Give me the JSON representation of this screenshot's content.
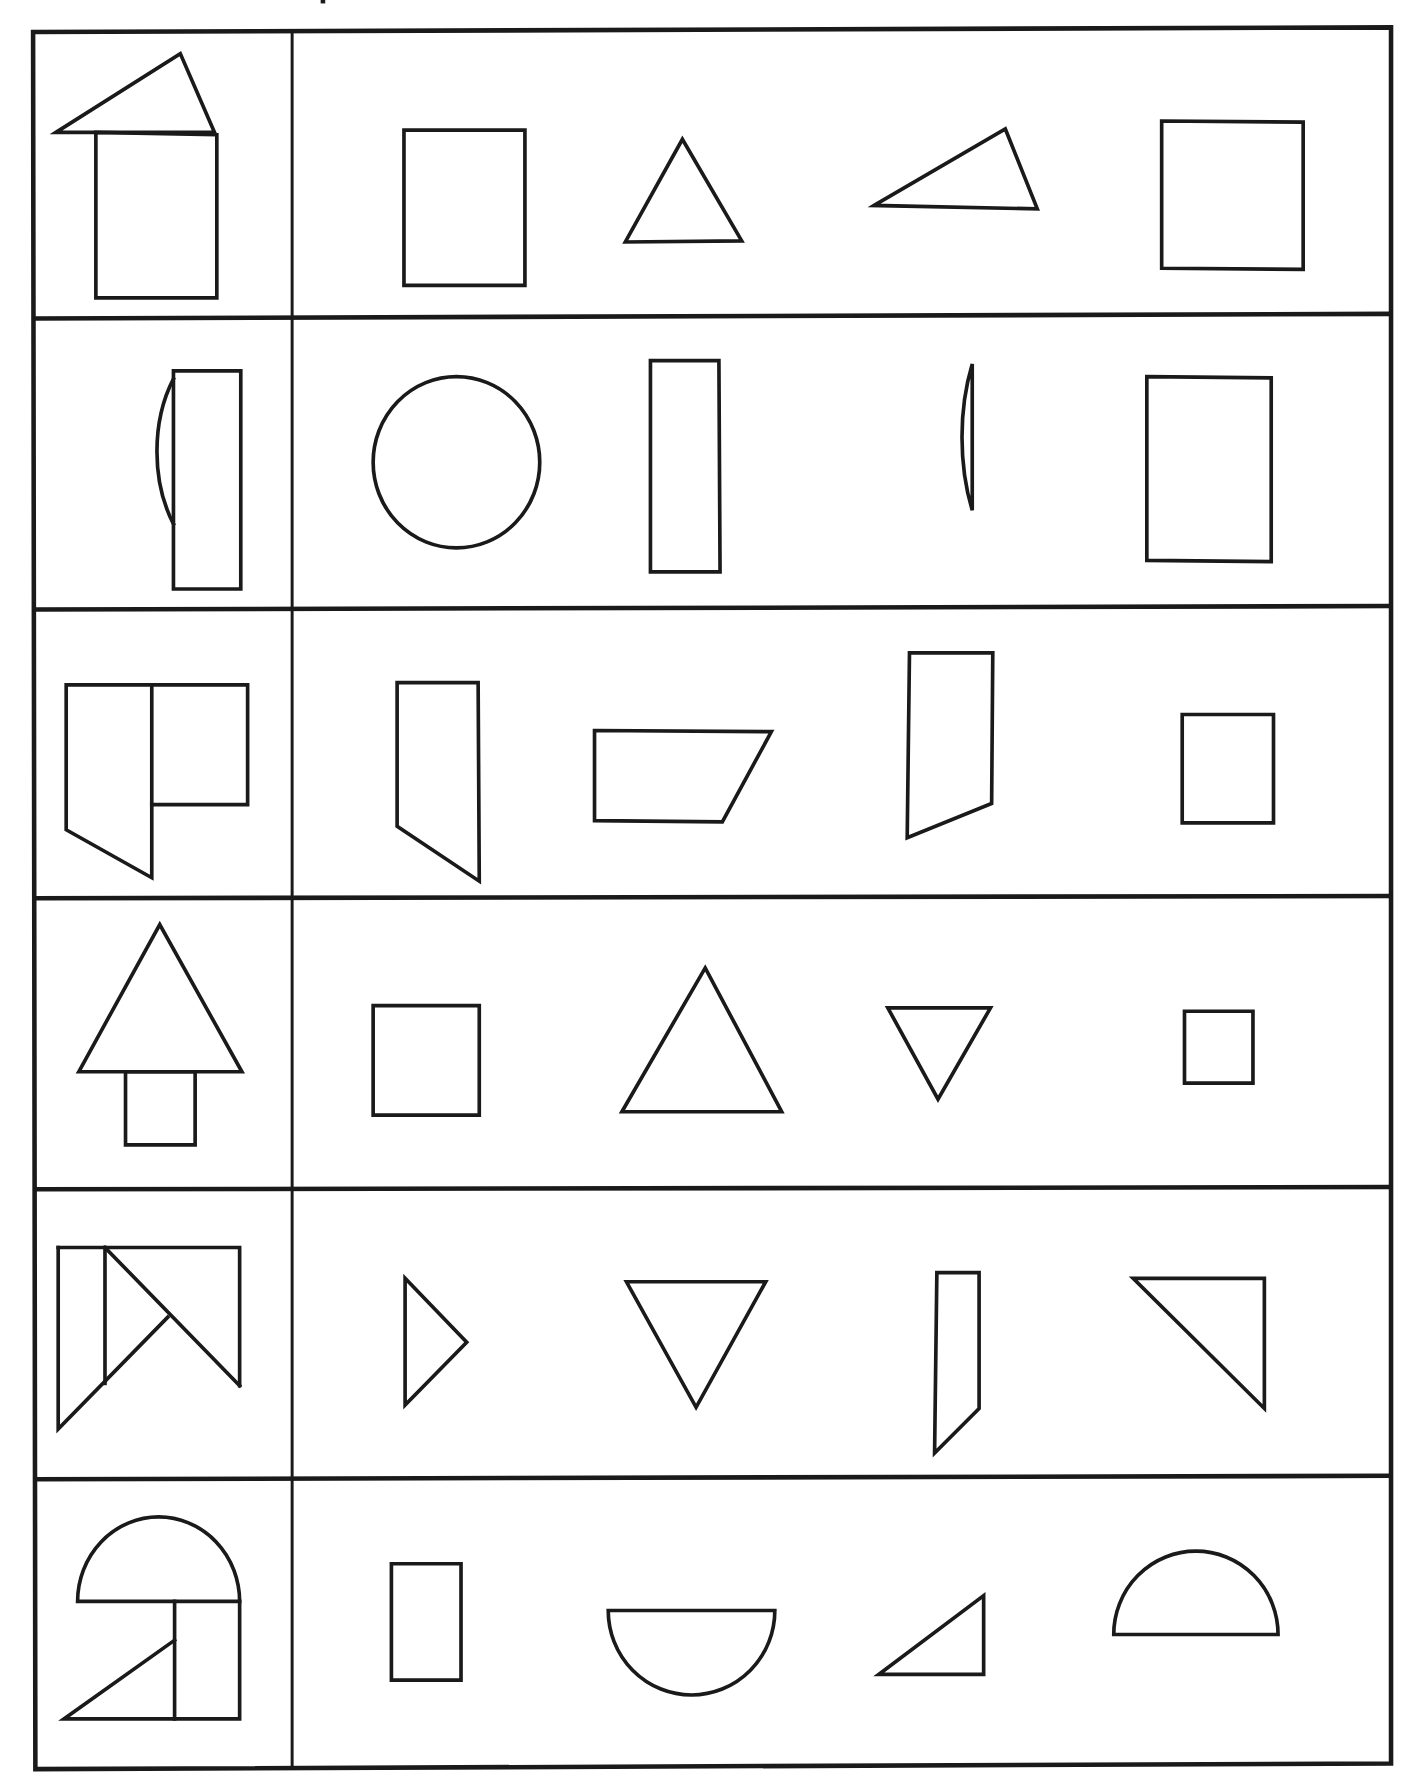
{
  "worksheet": {
    "title": "Shape composition matching worksheet",
    "instructions": "",
    "stroke_color": "#1a1a1a",
    "background_color": "#ffffff",
    "rows": [
      {
        "index": 1,
        "target": "house: scalene triangle roof on top of tall rectangle",
        "options": [
          "rectangle",
          "equilateral triangle",
          "scalene triangle",
          "rectangle"
        ]
      },
      {
        "index": 2,
        "target": "half circle attached to left of tall thin rectangle",
        "options": [
          "circle",
          "tall thin rectangle",
          "half circle",
          "rectangle"
        ]
      },
      {
        "index": 3,
        "target": "tall trapezoid with slanted bottom next to rectangle",
        "options": [
          "trapezoid slanted bottom",
          "parallelogram",
          "trapezoid slanted bottom (tall)",
          "square"
        ]
      },
      {
        "index": 4,
        "target": "tree: isosceles triangle on top of small rectangle",
        "options": [
          "square",
          "isosceles triangle",
          "inverted triangle",
          "small square"
        ]
      },
      {
        "index": 5,
        "target": "rectangle composed of triangles and a slanted strip",
        "options": [
          "right-pointing triangle",
          "inverted triangle",
          "thin strip with slanted bottom",
          "right triangle"
        ]
      },
      {
        "index": 6,
        "target": "half circle over rectangle with triangle",
        "options": [
          "rectangle",
          "downward half circle",
          "right triangle",
          "upward half circle"
        ]
      }
    ]
  }
}
